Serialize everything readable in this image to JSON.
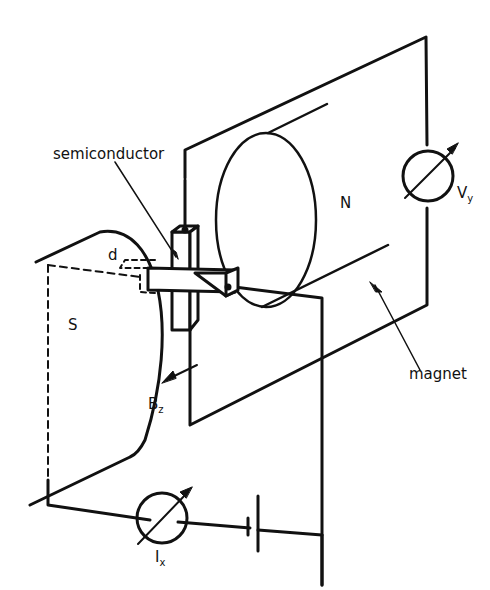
{
  "labels": {
    "semiconductor": "semiconductor",
    "north_pole": "N",
    "south_pole": "S",
    "magnet": "magnet",
    "thickness": "d",
    "field": {
      "main": "B",
      "sub": "z"
    },
    "current": {
      "main": "I",
      "sub": "x"
    },
    "voltage": {
      "main": "V",
      "sub": "y"
    }
  },
  "colors": {
    "stroke": "#111111",
    "background": "#ffffff"
  }
}
